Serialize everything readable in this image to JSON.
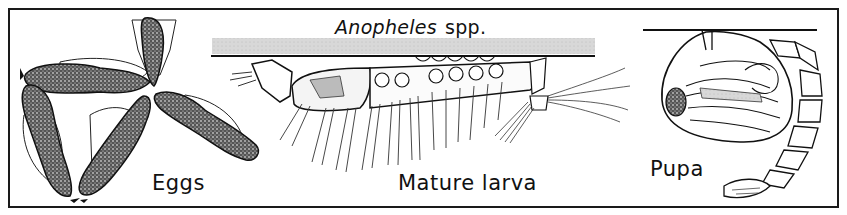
{
  "figure": {
    "title_genus": "Anopheles",
    "title_suffix": "spp.",
    "stages": [
      {
        "id": "eggs",
        "label": "Eggs"
      },
      {
        "id": "larva",
        "label": "Mature larva"
      },
      {
        "id": "pupa",
        "label": "Pupa"
      }
    ],
    "colors": {
      "ink": "#111111",
      "water_surface_band": "#d9d9d9",
      "background": "#ffffff"
    }
  }
}
